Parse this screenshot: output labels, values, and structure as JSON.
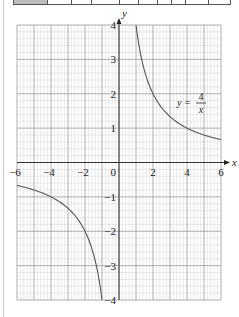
{
  "chart_data": {
    "type": "line",
    "title": "",
    "xlabel": "x",
    "ylabel": "y",
    "xlim": [
      -6,
      6
    ],
    "ylim": [
      -4,
      4
    ],
    "grid": true,
    "x_ticks": [
      "-6",
      "-4",
      "-2",
      "0",
      "2",
      "4",
      "6"
    ],
    "y_ticks": [
      "4",
      "3",
      "2",
      "1",
      "-1",
      "-2",
      "-3",
      "-4"
    ],
    "origin_label": "0",
    "annotation": {
      "lhs": "y =",
      "numerator": "4",
      "denominator": "x"
    },
    "series": [
      {
        "name": "y = 4/x",
        "function": "4/x",
        "x": [
          -6,
          -5,
          -4,
          -3,
          -2,
          -1.5,
          -1.2,
          -1,
          1,
          1.2,
          1.5,
          2,
          3,
          4,
          5,
          6
        ],
        "values": [
          -0.67,
          -0.8,
          -1,
          -1.33,
          -2,
          -2.67,
          -3.33,
          -4,
          4,
          3.33,
          2.67,
          2,
          1.33,
          1,
          0.8,
          0.67
        ]
      }
    ]
  },
  "top_table": {
    "cells": 10
  }
}
